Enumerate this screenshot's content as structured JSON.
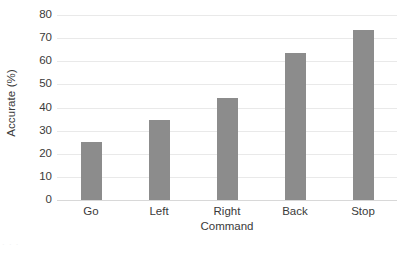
{
  "chart_data": {
    "type": "bar",
    "title": "",
    "subtitle": "",
    "xlabel": "Command",
    "ylabel": "Accurate (%)",
    "categories": [
      "Go",
      "Left",
      "Right",
      "Back",
      "Stop"
    ],
    "values": [
      25,
      34.5,
      44,
      63.5,
      73.5
    ],
    "series": [
      {
        "name": "Accuracy",
        "values": [
          25,
          34.5,
          44,
          63.5,
          73.5
        ]
      }
    ],
    "ylim": [
      0,
      80
    ],
    "ytick_labels": [
      "0",
      "10",
      "20",
      "30",
      "40",
      "50",
      "60",
      "70",
      "80"
    ],
    "ytick_values": [
      0,
      10,
      20,
      30,
      40,
      50,
      60,
      70,
      80
    ],
    "ytick_step": 10,
    "grid": true,
    "grid_axis": "y",
    "legend": false,
    "legend_position": "none",
    "bar_color": "#8c8c8c",
    "gridline_color": "#e9e9e9",
    "axis_text_color": "#3a3a3a",
    "background_color": "#ffffff",
    "annotations": []
  },
  "axes": {
    "y_title": "Accurate (%)",
    "x_title": "Command"
  },
  "artifact": {
    "bottom_left_text": "· · ·"
  }
}
